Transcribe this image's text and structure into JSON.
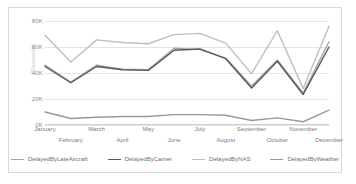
{
  "chart_data": {
    "type": "line",
    "title": "",
    "xlabel": "",
    "ylabel": "(Thousands)",
    "ylim": [
      0,
      80000
    ],
    "yticks": [
      0,
      20000,
      40000,
      60000,
      80000
    ],
    "ytick_labels": [
      "0K",
      "20K",
      "40K",
      "60K",
      "80K"
    ],
    "grid": true,
    "legend_position": "bottom",
    "categories": [
      "January",
      "February",
      "March",
      "April",
      "May",
      "June",
      "July",
      "August",
      "September",
      "October",
      "November",
      "December"
    ],
    "series": [
      {
        "name": "DelayedByLateAircraft",
        "color": "#a6a6a6",
        "values": [
          46000,
          33000,
          46000,
          43000,
          42500,
          59000,
          58000,
          51500,
          30000,
          50000,
          24500,
          64000
        ]
      },
      {
        "name": "DelayedByCarrier",
        "color": "#595959",
        "values": [
          45000,
          32500,
          45000,
          42500,
          42000,
          57500,
          58500,
          51000,
          28500,
          49000,
          23500,
          60000
        ]
      },
      {
        "name": "DelayedByNAS",
        "color": "#bfbfbf",
        "values": [
          69000,
          48500,
          65500,
          63500,
          62500,
          69500,
          70500,
          63000,
          39500,
          72500,
          28000,
          76000
        ]
      },
      {
        "name": "DelayedByWeather",
        "color": "#999999",
        "values": [
          10000,
          5000,
          6000,
          6500,
          6500,
          8000,
          8000,
          7500,
          3500,
          5500,
          2500,
          11500
        ]
      }
    ]
  },
  "legend": {
    "items": [
      {
        "label": "DelayedByLateAircraft"
      },
      {
        "label": "DelayedByCarrier"
      },
      {
        "label": "DelayedByNAS"
      },
      {
        "label": "DelayedByWeather"
      }
    ]
  }
}
